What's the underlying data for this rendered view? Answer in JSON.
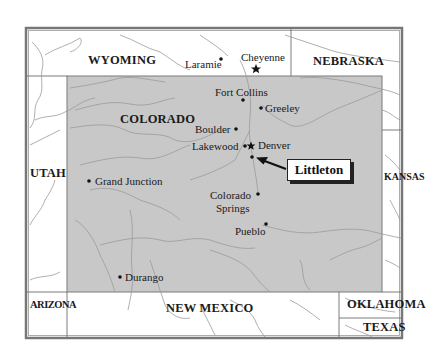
{
  "map": {
    "colors": {
      "colorado_fill": "#c8c8c8",
      "border": "#6d6d6d",
      "rivers": "#9a9a9a",
      "frame": "#777777",
      "callout_shadow": "#222222"
    },
    "states": {
      "wyoming": "WYOMING",
      "nebraska": "NEBRASKA",
      "colorado": "COLORADO",
      "utah": "UTAH",
      "kansas": "KANSAS",
      "arizona": "ARIZONA",
      "new_mexico": "NEW MEXICO",
      "oklahoma": "OKLAHOMA",
      "texas": "TEXAS"
    },
    "cities": {
      "laramie": "Laramie",
      "cheyenne": "Cheyenne",
      "fort_collins": "Fort Collins",
      "greeley": "Greeley",
      "boulder": "Boulder",
      "lakewood": "Lakewood",
      "denver": "Denver",
      "grand_junction": "Grand Junction",
      "colorado_springs_1": "Colorado",
      "colorado_springs_2": "Springs",
      "pueblo": "Pueblo",
      "durango": "Durango"
    },
    "callout": {
      "label": "Littleton"
    }
  }
}
